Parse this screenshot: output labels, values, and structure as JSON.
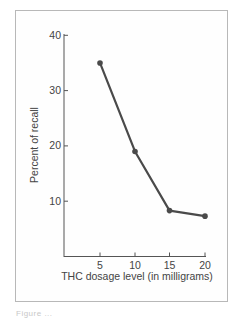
{
  "chart_data": {
    "type": "line",
    "title": "",
    "xlabel": "THC dosage level (in milligrams)",
    "ylabel": "Percent of recall",
    "x": [
      5,
      10,
      15,
      20
    ],
    "values": [
      35,
      19,
      8.3,
      7.3
    ],
    "x_ticks": [
      "5",
      "10",
      "15",
      "20"
    ],
    "y_ticks": [
      "10",
      "20",
      "30",
      "40"
    ],
    "xlim": [
      0,
      20
    ],
    "ylim": [
      0,
      40
    ],
    "grid": false,
    "legend": null,
    "line_color": "#4a4a4a"
  },
  "caption": "Figure ..."
}
